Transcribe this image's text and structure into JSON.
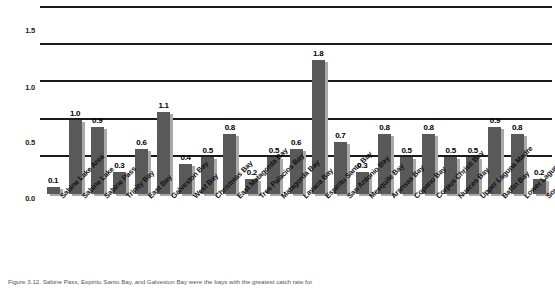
{
  "chart_data": {
    "type": "bar",
    "title": "",
    "subtitle": "",
    "xlabel": "",
    "ylabel": "",
    "ylim": [
      0.0,
      2.5
    ],
    "ytick_labels": [
      "0.0",
      "0.5",
      "1.0",
      "1.5",
      "2.0",
      "2.5"
    ],
    "ytick_values": [
      0.0,
      0.5,
      1.0,
      1.5,
      2.0,
      2.5
    ],
    "grid": true,
    "grid_axis": "y",
    "legend": false,
    "legend_position": "none",
    "data_labels": true,
    "bar_style": "3d-shadow",
    "categories": [
      "Sabine Lake Area",
      "Sabine Lake",
      "Sabine Pass",
      "Trinity Bay",
      "East Bay",
      "Galveston Bay",
      "West Bay",
      "Christmas Bay",
      "East Matagorda Bay",
      "Tres Palacios Bay",
      "Matagorda Bay",
      "Lavaca Bay",
      "Espiritu Santo Bay",
      "San Antonio Bay",
      "Mesquite Bay",
      "Aransas Bay",
      "Copano Bay",
      "Corpus Christi Bay",
      "Nueces Bay",
      "Upper Laguna Madre",
      "Baffin Bay",
      "Lower Laguna Madre",
      "South Bay"
    ],
    "values": [
      0.1,
      1.0,
      0.9,
      0.3,
      0.6,
      1.1,
      0.4,
      0.5,
      0.8,
      0.2,
      0.5,
      0.6,
      1.8,
      0.7,
      0.3,
      0.8,
      0.5,
      0.8,
      0.5,
      0.5,
      0.9,
      0.8,
      0.2
    ],
    "value_labels": [
      "0.1",
      "1.0",
      "0.9",
      "0.3",
      "0.6",
      "1.1",
      "0.4",
      "0.5",
      "0.8",
      "0.2",
      "0.5",
      "0.6",
      "1.8",
      "0.7",
      "0.3",
      "0.8",
      "0.5",
      "0.8",
      "0.5",
      "0.5",
      "0.9",
      "0.8",
      "0.2"
    ],
    "colors": {
      "bar_front": "#595959",
      "bar_shadow": "#a9a9a9",
      "gridline": "#1a1a1a",
      "text": "#000000",
      "background": "#ffffff"
    }
  },
  "caption": {
    "text": "Figure 3.12. Sabine Pass, Espiritu Santo Bay, and Galveston Bay were the bays with the greatest catch rate for"
  }
}
